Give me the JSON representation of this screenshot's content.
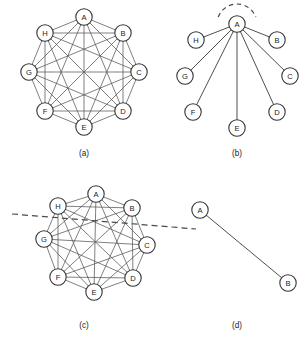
{
  "figure": {
    "title": "",
    "background_color": "#ffffff",
    "node_fill": "#ffffff",
    "node_stroke": "#333333",
    "edge_color": "#555555",
    "cut_color": "#4a4a4a"
  },
  "panels": [
    {
      "id": "a",
      "caption": "(a)",
      "caption_pos": {
        "x": 84,
        "y": 153
      },
      "type": "complete-graph",
      "node_radius": 8.2,
      "nodes": [
        {
          "label": "A",
          "x": 84,
          "y": 17
        },
        {
          "label": "B",
          "x": 123,
          "y": 33
        },
        {
          "label": "C",
          "x": 139,
          "y": 72
        },
        {
          "label": "D",
          "x": 123,
          "y": 111
        },
        {
          "label": "E",
          "x": 84,
          "y": 127
        },
        {
          "label": "F",
          "x": 45,
          "y": 111
        },
        {
          "label": "G",
          "x": 29,
          "y": 72
        },
        {
          "label": "H",
          "x": 45,
          "y": 33
        }
      ],
      "edges": [
        [
          "A",
          "B"
        ],
        [
          "A",
          "C"
        ],
        [
          "A",
          "D"
        ],
        [
          "A",
          "E"
        ],
        [
          "A",
          "F"
        ],
        [
          "A",
          "G"
        ],
        [
          "A",
          "H"
        ],
        [
          "B",
          "C"
        ],
        [
          "B",
          "D"
        ],
        [
          "B",
          "E"
        ],
        [
          "B",
          "F"
        ],
        [
          "B",
          "G"
        ],
        [
          "B",
          "H"
        ],
        [
          "C",
          "D"
        ],
        [
          "C",
          "E"
        ],
        [
          "C",
          "F"
        ],
        [
          "C",
          "G"
        ],
        [
          "C",
          "H"
        ],
        [
          "D",
          "E"
        ],
        [
          "D",
          "F"
        ],
        [
          "D",
          "G"
        ],
        [
          "D",
          "H"
        ],
        [
          "E",
          "F"
        ],
        [
          "E",
          "G"
        ],
        [
          "E",
          "H"
        ],
        [
          "F",
          "G"
        ],
        [
          "F",
          "H"
        ],
        [
          "G",
          "H"
        ]
      ],
      "cuts": []
    },
    {
      "id": "b",
      "caption": "(b)",
      "caption_pos": {
        "x": 237,
        "y": 153
      },
      "type": "star-graph",
      "node_radius": 8.2,
      "nodes": [
        {
          "label": "A",
          "x": 237,
          "y": 24
        },
        {
          "label": "H",
          "x": 196,
          "y": 40
        },
        {
          "label": "B",
          "x": 277,
          "y": 40
        },
        {
          "label": "G",
          "x": 185,
          "y": 76
        },
        {
          "label": "C",
          "x": 290,
          "y": 76
        },
        {
          "label": "F",
          "x": 193,
          "y": 112
        },
        {
          "label": "D",
          "x": 277,
          "y": 112
        },
        {
          "label": "E",
          "x": 237,
          "y": 128
        }
      ],
      "edges": [
        [
          "A",
          "H"
        ],
        [
          "A",
          "B"
        ],
        [
          "A",
          "G"
        ],
        [
          "A",
          "C"
        ],
        [
          "A",
          "F"
        ],
        [
          "A",
          "D"
        ],
        [
          "A",
          "E"
        ]
      ],
      "cuts": [
        {
          "shape": "arc",
          "cx": 237,
          "cy": 24,
          "r": 20,
          "start_deg": 200,
          "end_deg": 340
        }
      ]
    },
    {
      "id": "c",
      "caption": "(c)",
      "caption_pos": {
        "x": 84,
        "y": 325
      },
      "type": "partitioned-complete-graph",
      "node_radius": 8.2,
      "nodes": [
        {
          "label": "A",
          "x": 96,
          "y": 194
        },
        {
          "label": "H",
          "x": 58,
          "y": 206
        },
        {
          "label": "B",
          "x": 132,
          "y": 208
        },
        {
          "label": "G",
          "x": 44,
          "y": 239
        },
        {
          "label": "C",
          "x": 147,
          "y": 245
        },
        {
          "label": "F",
          "x": 58,
          "y": 277
        },
        {
          "label": "D",
          "x": 133,
          "y": 278
        },
        {
          "label": "E",
          "x": 94,
          "y": 292
        }
      ],
      "edges": [
        [
          "A",
          "B"
        ],
        [
          "A",
          "C"
        ],
        [
          "A",
          "D"
        ],
        [
          "A",
          "E"
        ],
        [
          "A",
          "F"
        ],
        [
          "A",
          "G"
        ],
        [
          "A",
          "H"
        ],
        [
          "B",
          "C"
        ],
        [
          "B",
          "D"
        ],
        [
          "B",
          "E"
        ],
        [
          "B",
          "F"
        ],
        [
          "B",
          "G"
        ],
        [
          "B",
          "H"
        ],
        [
          "C",
          "D"
        ],
        [
          "C",
          "E"
        ],
        [
          "C",
          "F"
        ],
        [
          "C",
          "G"
        ],
        [
          "C",
          "H"
        ],
        [
          "D",
          "E"
        ],
        [
          "D",
          "F"
        ],
        [
          "D",
          "G"
        ],
        [
          "D",
          "H"
        ],
        [
          "E",
          "F"
        ],
        [
          "E",
          "G"
        ],
        [
          "E",
          "H"
        ],
        [
          "F",
          "G"
        ],
        [
          "F",
          "H"
        ],
        [
          "G",
          "H"
        ]
      ],
      "cuts": [
        {
          "shape": "line",
          "x1": 12,
          "y1": 214,
          "x2": 196,
          "y2": 229
        }
      ]
    },
    {
      "id": "d",
      "caption": "(d)",
      "caption_pos": {
        "x": 237,
        "y": 325
      },
      "type": "edge-graph",
      "node_radius": 8.2,
      "nodes": [
        {
          "label": "A",
          "x": 200,
          "y": 210
        },
        {
          "label": "B",
          "x": 288,
          "y": 283
        }
      ],
      "edges": [
        [
          "A",
          "B"
        ]
      ],
      "cuts": []
    }
  ]
}
